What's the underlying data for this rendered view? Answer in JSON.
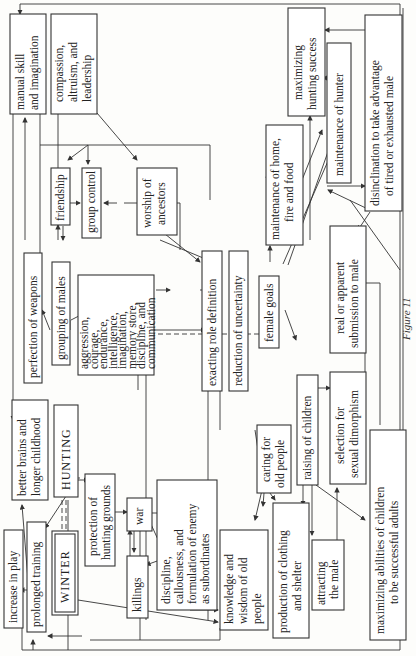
{
  "diagram": {
    "orientation": "rotated 90 degrees counter-clockwise",
    "caption": "Figure 11",
    "nodes": {
      "manual_skill": [
        "manual skill",
        "and imagination"
      ],
      "compassion": [
        "compassion,",
        "altruism, and",
        "leadership"
      ],
      "maximizing_hunting": [
        "maximizing",
        "hunting success"
      ],
      "maintenance_hunter": [
        "maintenance of hunter"
      ],
      "disinclination": [
        "disinclination to take advantage",
        "of tired or exhausted male"
      ],
      "friendship": [
        "friendship"
      ],
      "group_control": [
        "group control"
      ],
      "worship": [
        "worship of",
        "ancestors"
      ],
      "maintenance_home": [
        "maintenance of home,",
        "fire and food"
      ],
      "perfection_weapons": [
        "perfection of weapons"
      ],
      "grouping_males": [
        "grouping of males"
      ],
      "aggression": [
        "aggression,",
        "courage,",
        "endurance,",
        "intelligence,",
        "imagination,",
        "memory store,",
        "discipline, and",
        "communication"
      ],
      "exacting_role": [
        "exacting role definition"
      ],
      "reduction_uncertainty": [
        "reduction of uncertainty"
      ],
      "female_goals": [
        "female goals"
      ],
      "real_submission": [
        "real or apparent",
        "submission to male"
      ],
      "better_brains": [
        "better brains and",
        "longer childhood"
      ],
      "hunting": [
        "HUNTING"
      ],
      "caring_old": [
        "caring for",
        "old people"
      ],
      "raising_children": [
        "raising of children"
      ],
      "selection_dimorphism": [
        "selection for",
        "sexual dimorphism"
      ],
      "protection_grounds": [
        "protection of",
        "hunting grounds"
      ],
      "war": [
        "war"
      ],
      "discipline_callous": [
        "discipline,",
        "callousness, and",
        "formulation of enemy",
        "as subordinates"
      ],
      "increase_play": [
        "increase in play"
      ],
      "prolonged_training": [
        "prolonged training"
      ],
      "winter": [
        "WINTER"
      ],
      "killings": [
        "killings"
      ],
      "knowledge_wisdom": [
        "knowledge and",
        "wisdom of old",
        "people"
      ],
      "production_clothing": [
        "production of clothing",
        "and shelter"
      ],
      "attracting_male": [
        "attracting",
        "the male"
      ],
      "maximizing_children": [
        "maximizing abilities of children",
        "to be successful adults"
      ]
    }
  }
}
